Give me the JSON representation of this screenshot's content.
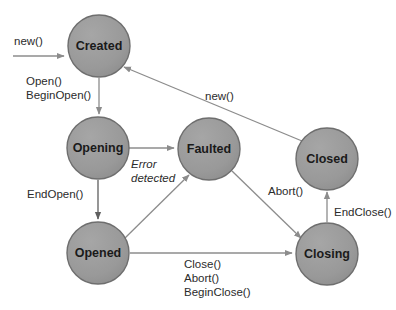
{
  "diagram": {
    "type": "state-machine",
    "background_color": "#ffffff",
    "node_fill_color": "#9a9a9a",
    "node_stroke_color": "#6e6e6e",
    "node_text_color": "#1a1a1a",
    "edge_color": "#8c8c8c",
    "edge_dark_color": "#5f5f5f",
    "label_color": "#2b2b2b",
    "node_radius": 31,
    "nodes": [
      {
        "id": "created",
        "label": "Created",
        "cx": 99,
        "cy": 46
      },
      {
        "id": "opening",
        "label": "Opening",
        "cx": 98,
        "cy": 148
      },
      {
        "id": "faulted",
        "label": "Faulted",
        "cx": 209,
        "cy": 149
      },
      {
        "id": "closed",
        "label": "Closed",
        "cx": 327,
        "cy": 159
      },
      {
        "id": "opened",
        "label": "Opened",
        "cx": 98,
        "cy": 253
      },
      {
        "id": "closing",
        "label": "Closing",
        "cx": 327,
        "cy": 254
      }
    ],
    "edges": [
      {
        "id": "start-to-created",
        "from": "start",
        "to": "created",
        "path": "M 13,56 L 64,56",
        "arrow": true,
        "tone": "light"
      },
      {
        "id": "created-to-opening",
        "from": "created",
        "to": "opening",
        "path": "M 99,78 L 99,114",
        "arrow": true,
        "tone": "light"
      },
      {
        "id": "opening-to-faulted",
        "from": "opening",
        "to": "faulted",
        "path": "M 129,148 L 174,148",
        "arrow": true,
        "tone": "light"
      },
      {
        "id": "opening-to-opened",
        "from": "opening",
        "to": "opened",
        "path": "M 98,180 L 98,219",
        "arrow": true,
        "tone": "dark"
      },
      {
        "id": "opened-to-faulted",
        "from": "opened",
        "to": "faulted",
        "path": "M 125,238 L 189,175",
        "arrow": true,
        "tone": "light"
      },
      {
        "id": "opened-to-closing",
        "from": "opened",
        "to": "closing",
        "path": "M 130,253 L 292,253",
        "arrow": true,
        "tone": "light"
      },
      {
        "id": "faulted-to-closing",
        "from": "faulted",
        "to": "closing",
        "path": "M 232,171 L 301,238",
        "arrow": true,
        "tone": "light"
      },
      {
        "id": "closing-to-closed",
        "from": "closing",
        "to": "closed",
        "path": "M 327,222 L 327,192",
        "arrow": true,
        "tone": "light"
      },
      {
        "id": "closed-to-created",
        "from": "closed",
        "to": "created",
        "path": "M 302,141 L 124,67",
        "arrow": true,
        "tone": "light"
      }
    ],
    "edge_labels": [
      {
        "id": "label-new-start",
        "lines": [
          "new()"
        ],
        "x": 14,
        "y": 45,
        "italic": false,
        "align": "start"
      },
      {
        "id": "label-open",
        "lines": [
          "Open()",
          "BeginOpen()"
        ],
        "x": 26,
        "y": 85,
        "italic": false,
        "align": "start"
      },
      {
        "id": "label-endopen",
        "lines": [
          "EndOpen()"
        ],
        "x": 27,
        "y": 198,
        "italic": false,
        "align": "start"
      },
      {
        "id": "label-error",
        "lines": [
          "Error",
          "detected"
        ],
        "x": 131,
        "y": 168,
        "italic": true,
        "align": "start"
      },
      {
        "id": "label-new-return",
        "lines": [
          "new()"
        ],
        "x": 205,
        "y": 100,
        "italic": false,
        "align": "start"
      },
      {
        "id": "label-abort",
        "lines": [
          "Abort()"
        ],
        "x": 268,
        "y": 195,
        "italic": false,
        "align": "start"
      },
      {
        "id": "label-endclose",
        "lines": [
          "EndClose()"
        ],
        "x": 334,
        "y": 216,
        "italic": false,
        "align": "start"
      },
      {
        "id": "label-close",
        "lines": [
          "Close()",
          "Abort()",
          "BeginClose()"
        ],
        "x": 184,
        "y": 268,
        "italic": false,
        "align": "start"
      }
    ]
  }
}
